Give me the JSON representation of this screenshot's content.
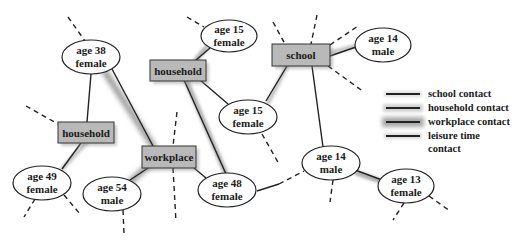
{
  "diagram": {
    "type": "contact-network",
    "persons": [
      {
        "id": "p38f",
        "line1": "age 38",
        "line2": "female"
      },
      {
        "id": "p15f_top",
        "line1": "age 15",
        "line2": "female"
      },
      {
        "id": "p14m_top",
        "line1": "age 14",
        "line2": "male"
      },
      {
        "id": "p15f_mid",
        "line1": "age 15",
        "line2": "female"
      },
      {
        "id": "p49f",
        "line1": "age 49",
        "line2": "female"
      },
      {
        "id": "p54m",
        "line1": "age 54",
        "line2": "male"
      },
      {
        "id": "p48f",
        "line1": "age 48",
        "line2": "female"
      },
      {
        "id": "p14m_low",
        "line1": "age 14",
        "line2": "male"
      },
      {
        "id": "p13f",
        "line1": "age 13",
        "line2": "female"
      }
    ],
    "places": [
      {
        "id": "household_top",
        "label": "household"
      },
      {
        "id": "school",
        "label": "school"
      },
      {
        "id": "household_left",
        "label": "household"
      },
      {
        "id": "workplace",
        "label": "workplace"
      }
    ],
    "edges": [
      {
        "from": "p38f",
        "to": "household_left",
        "type": "household"
      },
      {
        "from": "p38f",
        "to": "workplace",
        "type": "workplace"
      },
      {
        "from": "household_top",
        "to": "p15f_top",
        "type": "household"
      },
      {
        "from": "household_top",
        "to": "p15f_mid",
        "type": "household"
      },
      {
        "from": "household_top",
        "to": "p48f",
        "type": "household"
      },
      {
        "from": "school",
        "to": "p14m_top",
        "type": "school"
      },
      {
        "from": "school",
        "to": "p15f_mid",
        "type": "school"
      },
      {
        "from": "school",
        "to": "p14m_low",
        "type": "school"
      },
      {
        "from": "household_left",
        "to": "p49f",
        "type": "household"
      },
      {
        "from": "workplace",
        "to": "p54m",
        "type": "workplace"
      },
      {
        "from": "workplace",
        "to": "p48f",
        "type": "workplace"
      },
      {
        "from": "p48f",
        "to": "p14m_low",
        "type": "leisure"
      },
      {
        "from": "p14m_low",
        "to": "p13f",
        "type": "leisure"
      }
    ],
    "colors": {
      "place_fill": "#b9b9b9",
      "node_stroke": "#222222",
      "background": "#ffffff"
    }
  },
  "legend": {
    "items": [
      {
        "key": "school",
        "label": "school contact"
      },
      {
        "key": "household",
        "label": "household contact"
      },
      {
        "key": "workplace",
        "label": "workplace contact"
      },
      {
        "key": "leisure",
        "label": "leisure time contact"
      }
    ],
    "leisure_line1": "leisure time",
    "leisure_line2": "contact"
  }
}
